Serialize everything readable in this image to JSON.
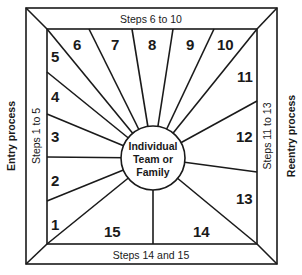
{
  "diagram": {
    "center_label": [
      "Individual",
      "Team or",
      "Family"
    ],
    "bands": {
      "top": "Steps 6 to 10",
      "left": "Steps 1 to 5",
      "right": "Steps 11 to 13",
      "bottom": "Steps 14 and 15"
    },
    "side_labels": {
      "left": "Entry process",
      "right": "Reentry process"
    },
    "segments": [
      "1",
      "2",
      "3",
      "4",
      "5",
      "6",
      "7",
      "8",
      "9",
      "10",
      "11",
      "12",
      "13",
      "14",
      "15"
    ],
    "colors": {
      "line": "#1a1a1a",
      "background": "#ffffff"
    }
  }
}
